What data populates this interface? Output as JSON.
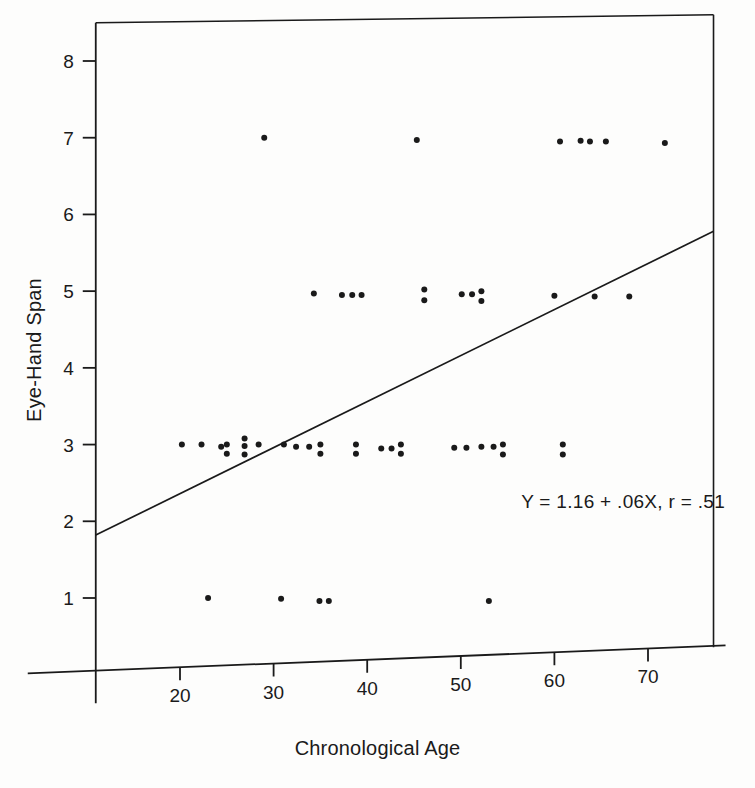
{
  "chart_data": {
    "type": "scatter",
    "title": "",
    "xlabel": "Chronological Age",
    "ylabel": "Eye-Hand Span",
    "xlim": [
      11,
      77
    ],
    "ylim": [
      0.2,
      8.55
    ],
    "xticks": [
      20,
      30,
      40,
      50,
      60,
      70
    ],
    "yticks": [
      1,
      2,
      3,
      4,
      5,
      6,
      7,
      8
    ],
    "grid": false,
    "legend": null,
    "annotation": "Y  =  1.16  +  .06X,  r  =  .51",
    "regression": {
      "intercept": 1.16,
      "slope": 0.06,
      "r": 0.51,
      "x_start": 11,
      "x_end": 77
    },
    "points": [
      {
        "x": 29.0,
        "y": 7.0
      },
      {
        "x": 45.3,
        "y": 6.97
      },
      {
        "x": 60.6,
        "y": 6.95
      },
      {
        "x": 62.8,
        "y": 6.96
      },
      {
        "x": 63.8,
        "y": 6.95
      },
      {
        "x": 65.5,
        "y": 6.95
      },
      {
        "x": 71.8,
        "y": 6.93
      },
      {
        "x": 34.3,
        "y": 4.97
      },
      {
        "x": 37.3,
        "y": 4.95
      },
      {
        "x": 38.4,
        "y": 4.95
      },
      {
        "x": 39.4,
        "y": 4.95
      },
      {
        "x": 46.1,
        "y": 5.02
      },
      {
        "x": 46.1,
        "y": 4.88
      },
      {
        "x": 50.1,
        "y": 4.96
      },
      {
        "x": 51.2,
        "y": 4.96
      },
      {
        "x": 52.2,
        "y": 5.0
      },
      {
        "x": 52.2,
        "y": 4.87
      },
      {
        "x": 60.0,
        "y": 4.94
      },
      {
        "x": 64.3,
        "y": 4.93
      },
      {
        "x": 68.0,
        "y": 4.93
      },
      {
        "x": 20.2,
        "y": 3.0
      },
      {
        "x": 22.3,
        "y": 3.0
      },
      {
        "x": 24.4,
        "y": 2.97
      },
      {
        "x": 25.0,
        "y": 3.0
      },
      {
        "x": 25.0,
        "y": 2.88
      },
      {
        "x": 26.9,
        "y": 3.08
      },
      {
        "x": 26.9,
        "y": 2.98
      },
      {
        "x": 26.9,
        "y": 2.87
      },
      {
        "x": 28.4,
        "y": 3.0
      },
      {
        "x": 31.1,
        "y": 3.0
      },
      {
        "x": 32.4,
        "y": 2.97
      },
      {
        "x": 33.8,
        "y": 2.97
      },
      {
        "x": 35.0,
        "y": 3.0
      },
      {
        "x": 35.0,
        "y": 2.88
      },
      {
        "x": 38.8,
        "y": 3.0
      },
      {
        "x": 38.8,
        "y": 2.88
      },
      {
        "x": 41.5,
        "y": 2.95
      },
      {
        "x": 42.6,
        "y": 2.95
      },
      {
        "x": 43.6,
        "y": 3.0
      },
      {
        "x": 43.6,
        "y": 2.88
      },
      {
        "x": 49.3,
        "y": 2.96
      },
      {
        "x": 50.6,
        "y": 2.96
      },
      {
        "x": 52.2,
        "y": 2.97
      },
      {
        "x": 53.5,
        "y": 2.97
      },
      {
        "x": 54.5,
        "y": 3.0
      },
      {
        "x": 54.5,
        "y": 2.87
      },
      {
        "x": 60.9,
        "y": 3.0
      },
      {
        "x": 60.9,
        "y": 2.87
      },
      {
        "x": 23.0,
        "y": 1.0
      },
      {
        "x": 30.8,
        "y": 0.99
      },
      {
        "x": 34.9,
        "y": 0.96
      },
      {
        "x": 35.9,
        "y": 0.96
      },
      {
        "x": 53.0,
        "y": 0.96
      }
    ]
  },
  "axes": {
    "y_label": "Eye-Hand Span",
    "x_label": "Chronological Age",
    "x_tick_labels": [
      "20",
      "30",
      "40",
      "50",
      "60",
      "70"
    ],
    "y_tick_labels": [
      "1",
      "2",
      "3",
      "4",
      "5",
      "6",
      "7",
      "8"
    ]
  },
  "annotation": {
    "equation": "Y  =  1.16  +  .06X,  r  =  .51"
  },
  "style": {
    "ink": "#1a1a1a",
    "background": "#fdfdfc",
    "point_radius": 3.0
  }
}
